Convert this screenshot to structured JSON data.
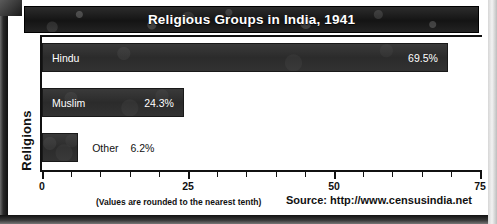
{
  "chart_data": {
    "type": "bar",
    "orientation": "horizontal",
    "title": "Religious Groups in India, 1941",
    "xlabel": "",
    "ylabel": "Religions",
    "categories": [
      "Hindu",
      "Muslim",
      "Other"
    ],
    "values": [
      69.5,
      24.3,
      6.2
    ],
    "value_labels": [
      "69.5%",
      "24.3%",
      "6.2%"
    ],
    "xlim": [
      0,
      75
    ],
    "xticks_major": [
      0,
      25,
      50,
      75
    ],
    "xtick_labels": [
      "0",
      "25",
      "50",
      "75"
    ],
    "xtick_minor_step": 5,
    "grid": false,
    "legend": null,
    "note": "(Values are rounded to the nearest tenth)",
    "source": "Source: http://www.censusindia.net",
    "colors": {
      "bar_fill": "#2f2f2f",
      "bar_label_inside": "#ffffff",
      "bar_label_outside": "#111111",
      "title_bar": "#1c1c1c",
      "title_text": "#ffffff",
      "axis": "#111111",
      "background": "#ffffff"
    }
  }
}
